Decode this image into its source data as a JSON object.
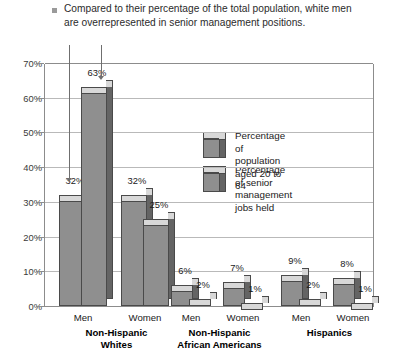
{
  "caption": {
    "bullet_icon": "square-bullet-icon",
    "text": "Compared to their percentage of the total population, white men are overrepresented in senior management positions."
  },
  "legend": {
    "items": [
      {
        "icon": "cube-icon",
        "label": "Percentage of population\naged 20 to 64"
      },
      {
        "icon": "cube-icon",
        "label": "Percentage of senior\nmanagement jobs held"
      }
    ]
  },
  "colors": {
    "bar_front": "#8f8f8f",
    "bar_side": "#646464",
    "bar_top": "#d8d8d8",
    "bar_outline": "#4a4a4a",
    "gridline": "#b9b9b9",
    "axis": "#8c8c8c",
    "bullet": "#9a9a9a"
  },
  "axis": {
    "y_ticks": [
      "0%",
      "10%",
      "20%",
      "30%",
      "40%",
      "50%",
      "60%",
      "70%"
    ],
    "y_min": 0,
    "y_max": 70
  },
  "groups": [
    {
      "name": "Non-Hispanic Whites",
      "label_lines": "Non-Hispanic\nWhites",
      "subgroups": [
        {
          "label": "Men",
          "population": "32%",
          "senior": "63%"
        },
        {
          "label": "Women",
          "population": "32%",
          "senior": "25%"
        }
      ]
    },
    {
      "name": "Non-Hispanic African Americans",
      "label_lines": "Non-Hispanic\nAfrican Americans",
      "subgroups": [
        {
          "label": "Men",
          "population": "6%",
          "senior": "2%"
        },
        {
          "label": "Women",
          "population": "7%",
          "senior": "1%"
        }
      ]
    },
    {
      "name": "Hispanics",
      "label_lines": "Hispanics",
      "subgroups": [
        {
          "label": "Men",
          "population": "9%",
          "senior": "2%"
        },
        {
          "label": "Women",
          "population": "8%",
          "senior": "1%"
        }
      ]
    }
  ],
  "chart_data": {
    "type": "bar",
    "title": "Compared to their percentage of the total population, white men are overrepresented in senior management positions.",
    "xlabel": "",
    "ylabel": "",
    "ylim": [
      0,
      70
    ],
    "ytick_labels": [
      "0%",
      "10%",
      "20%",
      "30%",
      "40%",
      "50%",
      "60%",
      "70%"
    ],
    "grid": true,
    "legend_position": "inside-top-center",
    "categories": [
      "Non-Hispanic Whites - Men",
      "Non-Hispanic Whites - Women",
      "Non-Hispanic African Americans - Men",
      "Non-Hispanic African Americans - Women",
      "Hispanics - Men",
      "Hispanics - Women"
    ],
    "series": [
      {
        "name": "Percentage of population aged 20 to 64",
        "values": [
          32,
          32,
          6,
          7,
          9,
          8
        ]
      },
      {
        "name": "Percentage of senior management jobs held",
        "values": [
          63,
          25,
          2,
          1,
          2,
          1
        ]
      }
    ]
  }
}
